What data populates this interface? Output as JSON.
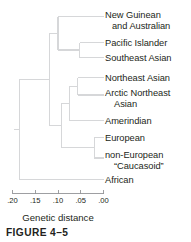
{
  "figure": {
    "caption": "FIGURE 4–5",
    "axis_title": "Genetic distance"
  },
  "axis": {
    "ticks": [
      {
        "value": ".20",
        "pos": 0.2
      },
      {
        "value": ".15",
        "pos": 0.15
      },
      {
        "value": ".10",
        "pos": 0.1
      },
      {
        "value": ".05",
        "pos": 0.05
      },
      {
        "value": ".00",
        "pos": 0.0
      }
    ],
    "min": 0.0,
    "max": 0.2,
    "direction": "right-to-left",
    "line_color": "#939598"
  },
  "leaves": [
    {
      "id": "new-guinean-australian",
      "line1": "New Guinean",
      "line2": "and Australian"
    },
    {
      "id": "pacific-islander",
      "line1": "Pacific Islander",
      "line2": ""
    },
    {
      "id": "southeast-asian",
      "line1": "Southeast Asian",
      "line2": ""
    },
    {
      "id": "northeast-asian",
      "line1": "Northeast Asian",
      "line2": ""
    },
    {
      "id": "arctic-northeast-asian",
      "line1": "Arctic Northeast",
      "line2": "Asian"
    },
    {
      "id": "amerindian",
      "line1": "Amerindian",
      "line2": ""
    },
    {
      "id": "european",
      "line1": "European",
      "line2": ""
    },
    {
      "id": "non-european-caucasoid",
      "line1": "non-European",
      "line2": "“Caucasoid”"
    },
    {
      "id": "african",
      "line1": "African",
      "line2": ""
    }
  ],
  "chart_data": {
    "type": "dendrogram",
    "title": "",
    "xlabel": "Genetic distance",
    "ylabel": "",
    "xlim": [
      0.2,
      0.0
    ],
    "xticks": [
      0.2,
      0.15,
      0.1,
      0.05,
      0.0
    ],
    "xticklabels": [
      ".20",
      ".15",
      ".10",
      ".05",
      ".00"
    ],
    "grid": false,
    "legend": "none",
    "line_color": "#d6d7d9",
    "leaf_order": [
      "New Guinean and Australian",
      "Pacific Islander",
      "Southeast Asian",
      "Northeast Asian",
      "Arctic Northeast Asian",
      "Amerindian",
      "European",
      "non-European “Caucasoid”",
      "African"
    ],
    "merges": [
      {
        "name": "n1",
        "children": [
          "Pacific Islander",
          "Southeast Asian"
        ],
        "distance": 0.052
      },
      {
        "name": "n2",
        "children": [
          "New Guinean and Australian",
          "n1"
        ],
        "distance": 0.1
      },
      {
        "name": "n3",
        "children": [
          "Northeast Asian",
          "Arctic Northeast Asian"
        ],
        "distance": 0.057
      },
      {
        "name": "n4",
        "children": [
          "n3",
          "Amerindian"
        ],
        "distance": 0.075
      },
      {
        "name": "n5",
        "children": [
          "European",
          "non-European “Caucasoid”"
        ],
        "distance": 0.02
      },
      {
        "name": "n6",
        "children": [
          "n4",
          "n5"
        ],
        "distance": 0.092
      },
      {
        "name": "n7",
        "children": [
          "n2",
          "n6"
        ],
        "distance": 0.118
      },
      {
        "name": "n8",
        "children": [
          "n7",
          "African"
        ],
        "distance": 0.185
      }
    ]
  }
}
